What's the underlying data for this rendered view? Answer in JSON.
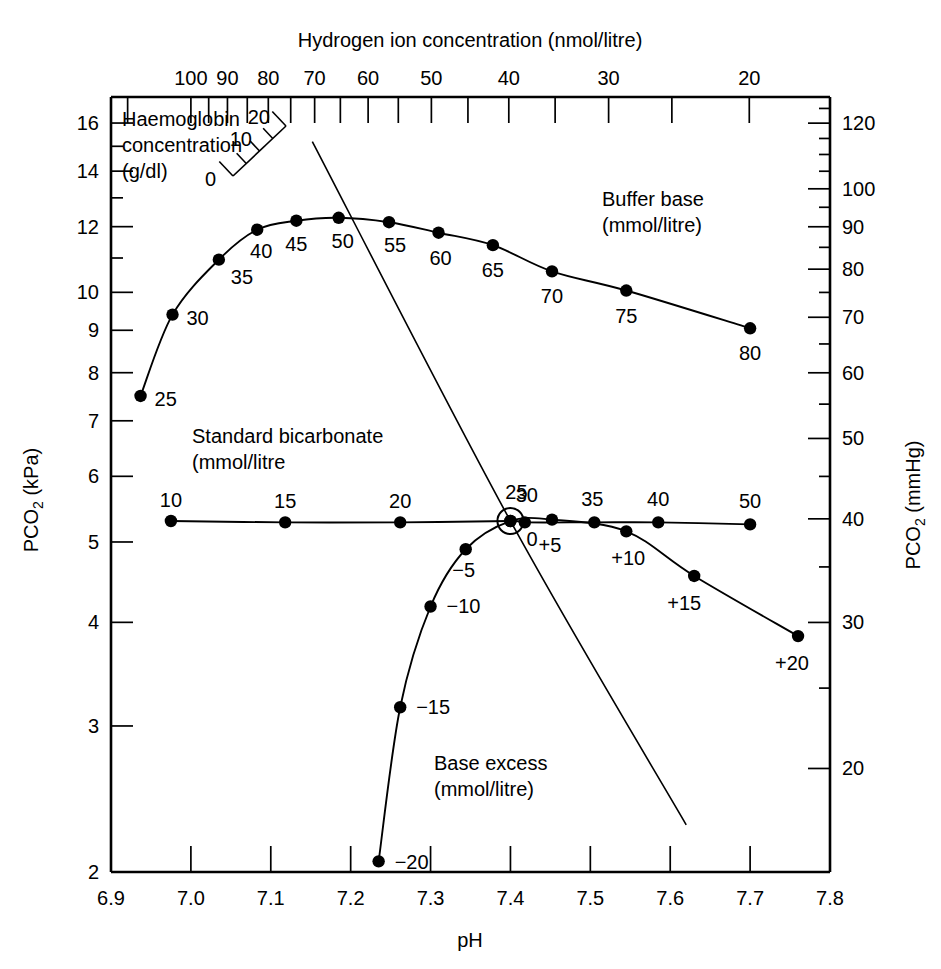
{
  "figure": {
    "top_axis_title": "Hydrogen ion concentration (nmol/litre)",
    "bottom_axis_title": "pH",
    "left_axis_title": "PCO2 (kPa)",
    "left_axis_title_parts": {
      "p": "P",
      "co": "CO",
      "sub": "2",
      "unit": " (kPa)"
    },
    "right_axis_title_parts": {
      "p": "P",
      "co": "CO",
      "sub": "2",
      "unit": " (mmHg)"
    }
  },
  "axes": {
    "bottom": {
      "label": "pH",
      "ticks": [
        "6.9",
        "7.0",
        "7.1",
        "7.2",
        "7.3",
        "7.4",
        "7.5",
        "7.6",
        "7.7",
        "7.8"
      ],
      "values": [
        6.9,
        7.0,
        7.1,
        7.2,
        7.3,
        7.4,
        7.5,
        7.6,
        7.7,
        7.8
      ],
      "range": [
        6.9,
        7.8
      ]
    },
    "top": {
      "label": "Hydrogen ion concentration (nmol/litre)",
      "ticks": [
        "100",
        "90",
        "80",
        "70",
        "60",
        "50",
        "40",
        "30",
        "20"
      ],
      "values": [
        100,
        90,
        80,
        70,
        60,
        50,
        40,
        30,
        20
      ],
      "minor_values": [
        95,
        85,
        75,
        65,
        55,
        45,
        35,
        25,
        120
      ]
    },
    "left": {
      "label": "PCO2 (kPa)",
      "ticks": [
        "16",
        "14",
        "12",
        "10",
        "9",
        "8",
        "7",
        "6",
        "5",
        "4",
        "3",
        "2"
      ],
      "values": [
        16,
        14,
        12,
        10,
        9,
        8,
        7,
        6,
        5,
        4,
        3,
        2
      ],
      "range": [
        2,
        17.2
      ],
      "scale": "log"
    },
    "right": {
      "label": "PCO2 (mmHg)",
      "ticks": [
        "120",
        "100",
        "90",
        "80",
        "70",
        "60",
        "50",
        "40",
        "30",
        "20"
      ],
      "values": [
        120,
        100,
        90,
        80,
        70,
        60,
        50,
        40,
        30,
        20
      ],
      "unit_conversion_kpa_per_mmhg": 0.1333
    }
  },
  "annotations": {
    "haemoglobin": {
      "line1": "Haemoglobin",
      "line2": "concentration",
      "line3": "(g/dl)",
      "scale_labels": [
        "0",
        "10",
        "20"
      ],
      "scale_values": [
        0,
        10,
        20
      ]
    },
    "buffer_base": {
      "line1": "Buffer base",
      "line2": "(mmol/litre)"
    },
    "standard_bicarbonate": {
      "line1": "Standard bicarbonate",
      "line2": "(mmol/litre"
    },
    "base_excess": {
      "line1": "Base excess",
      "line2": "(mmol/litre)"
    }
  },
  "chart_data": {
    "type": "line",
    "title": "",
    "xlabel": "pH",
    "ylabel": "PCO2 (kPa)",
    "xlim": [
      6.9,
      7.8
    ],
    "ylim": [
      2,
      17.2
    ],
    "yscale": "log",
    "grid": false,
    "legend": "none",
    "secondary_x": {
      "label": "Hydrogen ion concentration (nmol/litre)",
      "ticks": [
        100,
        90,
        80,
        70,
        60,
        50,
        40,
        30,
        20
      ]
    },
    "secondary_y": {
      "label": "PCO2 (mmHg)",
      "ticks": [
        120,
        100,
        90,
        80,
        70,
        60,
        50,
        40,
        30,
        20
      ]
    },
    "normal_point": {
      "ph": 7.4,
      "pco2_kpa": 5.3,
      "pco2_mmhg": 40,
      "marker": "open-circle"
    },
    "series": [
      {
        "name": "Buffer base (mmol/litre)",
        "points": [
          {
            "label": "25",
            "ph": 6.937,
            "pco2_kpa": 7.5
          },
          {
            "label": "30",
            "ph": 6.977,
            "pco2_kpa": 9.4
          },
          {
            "label": "35",
            "ph": 7.035,
            "pco2_kpa": 10.95
          },
          {
            "label": "40",
            "ph": 7.083,
            "pco2_kpa": 11.9
          },
          {
            "label": "45",
            "ph": 7.132,
            "pco2_kpa": 12.2
          },
          {
            "label": "50",
            "ph": 7.185,
            "pco2_kpa": 12.3
          },
          {
            "label": "55",
            "ph": 7.248,
            "pco2_kpa": 12.15
          },
          {
            "label": "60",
            "ph": 7.31,
            "pco2_kpa": 11.8
          },
          {
            "label": "65",
            "ph": 7.378,
            "pco2_kpa": 11.4
          },
          {
            "label": "70",
            "ph": 7.452,
            "pco2_kpa": 10.6
          },
          {
            "label": "75",
            "ph": 7.545,
            "pco2_kpa": 10.05
          },
          {
            "label": "80",
            "ph": 7.7,
            "pco2_kpa": 9.05
          }
        ]
      },
      {
        "name": "Standard bicarbonate (mmol/litre)",
        "points": [
          {
            "label": "10",
            "ph": 6.975,
            "pco2_kpa": 5.3
          },
          {
            "label": "15",
            "ph": 7.118,
            "pco2_kpa": 5.28
          },
          {
            "label": "20",
            "ph": 7.262,
            "pco2_kpa": 5.28
          },
          {
            "label": "25",
            "ph": 7.4,
            "pco2_kpa": 5.3
          },
          {
            "label": "30",
            "ph": 7.418,
            "pco2_kpa": 5.28
          },
          {
            "label": "35",
            "ph": 7.505,
            "pco2_kpa": 5.28
          },
          {
            "label": "40",
            "ph": 7.585,
            "pco2_kpa": 5.28
          },
          {
            "label": "50",
            "ph": 7.7,
            "pco2_kpa": 5.25
          }
        ]
      },
      {
        "name": "Base excess (mmol/litre)",
        "points": [
          {
            "label": "-20",
            "ph": 7.235,
            "pco2_kpa": 2.06
          },
          {
            "label": "-15",
            "ph": 7.262,
            "pco2_kpa": 3.16
          },
          {
            "label": "-10",
            "ph": 7.3,
            "pco2_kpa": 4.18
          },
          {
            "label": "-5",
            "ph": 7.344,
            "pco2_kpa": 4.9
          },
          {
            "label": "0",
            "ph": 7.4,
            "pco2_kpa": 5.3
          },
          {
            "label": "+5",
            "ph": 7.452,
            "pco2_kpa": 5.32
          },
          {
            "label": "+10",
            "ph": 7.545,
            "pco2_kpa": 5.15
          },
          {
            "label": "+15",
            "ph": 7.63,
            "pco2_kpa": 4.55
          },
          {
            "label": "+20",
            "ph": 7.76,
            "pco2_kpa": 3.85
          }
        ]
      },
      {
        "name": "Haemoglobin titration line",
        "points": [
          {
            "label": "",
            "ph": 7.152,
            "pco2_kpa": 15.2
          },
          {
            "label": "",
            "ph": 7.4,
            "pco2_kpa": 5.3
          },
          {
            "label": "",
            "ph": 7.62,
            "pco2_kpa": 2.28
          }
        ]
      }
    ]
  }
}
